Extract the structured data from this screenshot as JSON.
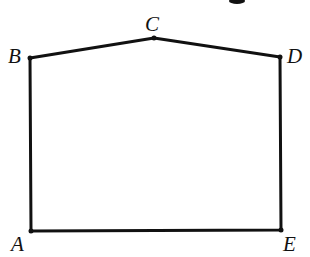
{
  "figure": {
    "type": "geometry-pentagon",
    "stroke_color": "#111111",
    "points": {
      "A": {
        "label": "A",
        "x": 31,
        "y": 231
      },
      "B": {
        "label": "B",
        "x": 30,
        "y": 58
      },
      "C": {
        "label": "C",
        "x": 154,
        "y": 38
      },
      "D": {
        "label": "D",
        "x": 280,
        "y": 57
      },
      "E": {
        "label": "E",
        "x": 281,
        "y": 230
      }
    },
    "segments": [
      "AB",
      "BC",
      "CD",
      "DE",
      "EA"
    ]
  }
}
